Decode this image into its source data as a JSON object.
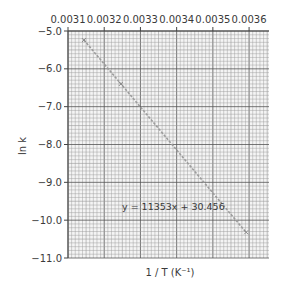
{
  "chart_data": {
    "type": "scatter",
    "title": "",
    "xlabel": "1 / T (K⁻¹)",
    "ylabel": "ln k",
    "x_tick_labels": [
      "0.0031",
      "0.0032",
      "0.0033",
      "0.0034",
      "0.0035",
      "0.0036"
    ],
    "x_ticks": [
      0.0031,
      0.0032,
      0.0033,
      0.0034,
      0.0035,
      0.0036
    ],
    "y_tick_labels": [
      "-5.0",
      "-6.0",
      "-7.0",
      "-8.0",
      "-9.0",
      "-10.0",
      "-11.0"
    ],
    "y_ticks": [
      -5.0,
      -6.0,
      -7.0,
      -8.0,
      -9.0,
      -10.0,
      -11.0
    ],
    "xlim": [
      0.0031,
      0.003655
    ],
    "ylim": [
      -11.0,
      -5.0
    ],
    "x_axis_position": "top",
    "grid": true,
    "grid_minor_divisions": 10,
    "series": [
      {
        "name": "data",
        "x": [
          0.003144,
          0.003246,
          0.003592
        ],
        "y": [
          -5.24,
          -6.4,
          -10.32
        ]
      }
    ],
    "trendline": {
      "equation_label": "y = 11353x + 30.456",
      "slope": -11353,
      "intercept": 30.456,
      "x_range": [
        0.003144,
        0.003592
      ]
    },
    "annotations": [
      {
        "text": "y = 11353x + 30.456",
        "x": 0.00336,
        "y": -9.6
      }
    ],
    "colors": {
      "grid_minor": "#9a9a9a",
      "grid_major": "#555555",
      "axis": "#444444",
      "line": "#9c9c9c",
      "text": "#3a3a3a"
    }
  }
}
